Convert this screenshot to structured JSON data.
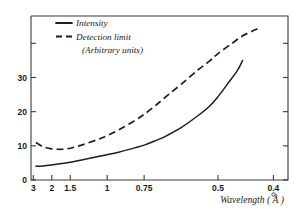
{
  "chart_data": {
    "type": "line",
    "title": "",
    "subtitle": "",
    "xlabel": "Wavelength ( Å )",
    "ylabel": "",
    "grid": false,
    "legend_position": "top-left",
    "x_tick_labels": [
      "3",
      "2",
      "1.5",
      "1",
      "0.75",
      "0.5",
      "0.4"
    ],
    "x_tick_values": [
      3,
      2,
      1.5,
      1,
      0.75,
      0.5,
      0.4
    ],
    "x_scale": "reciprocal (1/lambda), decreasing wavelength to the right",
    "xlim": [
      3.2,
      0.38
    ],
    "y_tick_labels": [
      "0",
      "10",
      "20",
      "30"
    ],
    "y_tick_values": [
      0,
      10,
      20,
      30
    ],
    "y_minor_tick_values": [
      40
    ],
    "ylim": [
      0,
      48
    ],
    "series": [
      {
        "name": "Intensity",
        "style": "solid",
        "color": "#1d1d1d",
        "x": [
          2.8,
          2.4,
          2.0,
          1.7,
          1.5,
          1.25,
          1.0,
          0.9,
          0.8,
          0.75,
          0.7,
          0.65,
          0.6,
          0.55,
          0.52,
          0.5,
          0.48,
          0.46,
          0.45
        ],
        "values": [
          4.0,
          4.1,
          4.4,
          4.8,
          5.2,
          6.1,
          7.4,
          8.2,
          9.4,
          10.2,
          11.4,
          13.0,
          15.3,
          18.8,
          21.6,
          24.4,
          28.0,
          32.0,
          35.0
        ]
      },
      {
        "name": "Detection limit",
        "style": "dashed",
        "color": "#1d1d1d",
        "x": [
          2.8,
          2.4,
          2.0,
          1.8,
          1.7,
          1.6,
          1.5,
          1.3,
          1.1,
          1.0,
          0.9,
          0.8,
          0.75,
          0.7,
          0.65,
          0.6,
          0.55,
          0.52,
          0.5,
          0.47,
          0.45,
          0.43,
          0.42
        ],
        "values": [
          11.0,
          9.8,
          9.1,
          9.0,
          9.0,
          9.1,
          9.3,
          10.2,
          11.8,
          13.0,
          14.8,
          17.4,
          19.2,
          21.6,
          24.6,
          28.0,
          32.2,
          34.8,
          37.0,
          40.0,
          42.2,
          43.8,
          44.6
        ]
      }
    ],
    "legend": [
      {
        "label": "Intensity",
        "style": "solid"
      },
      {
        "label": "Detection  limit",
        "style": "dashed"
      },
      {
        "label": "(Arbitrary units)",
        "style": "none"
      }
    ],
    "annotations": []
  },
  "figure": {
    "units_note": "(Arbitrary units)"
  }
}
